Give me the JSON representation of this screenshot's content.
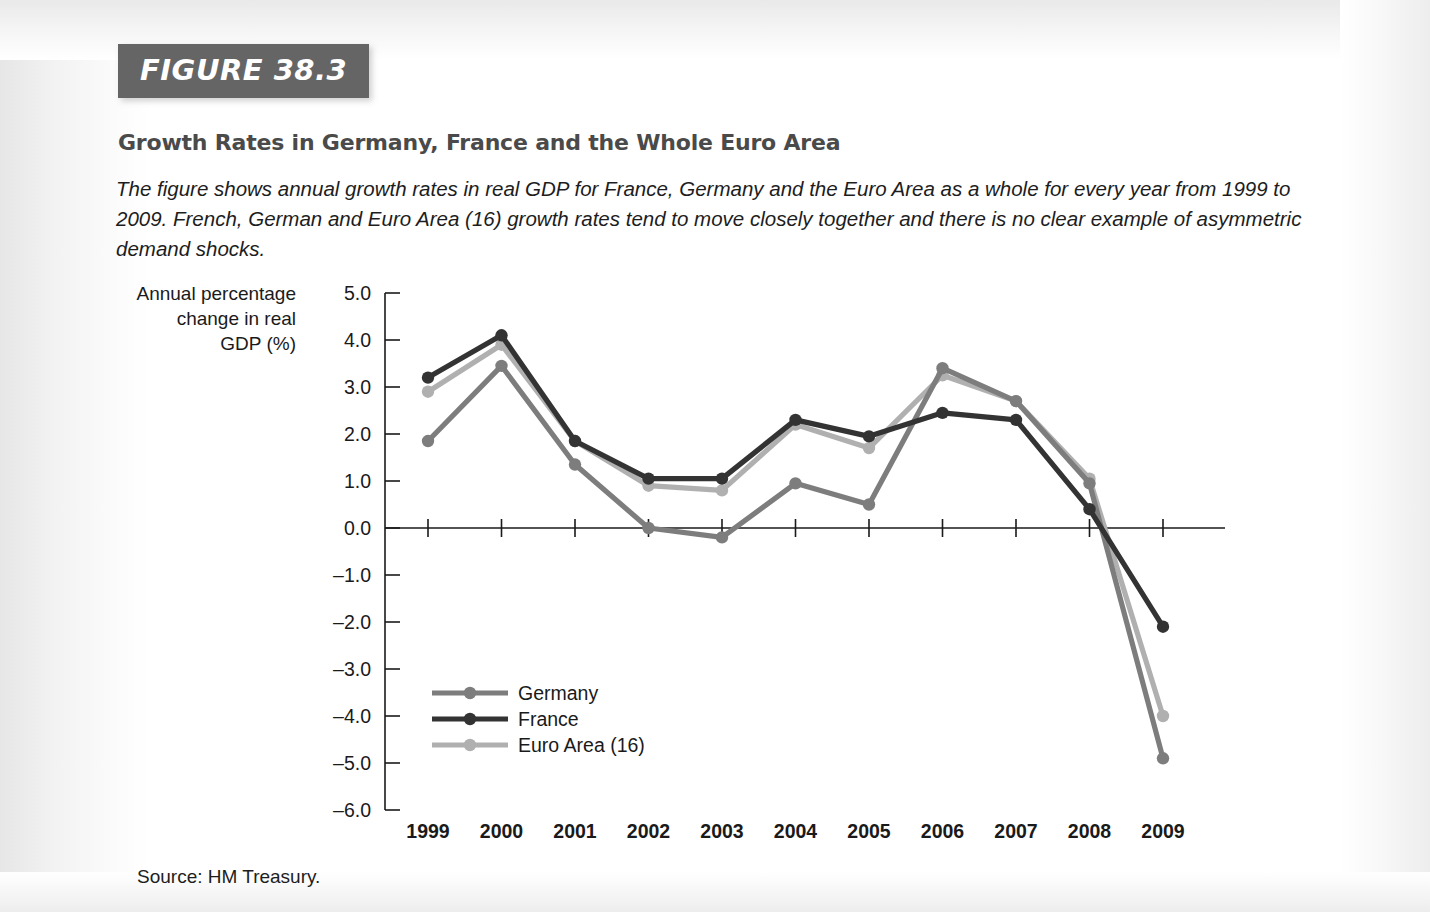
{
  "figure": {
    "banner_label": "FIGURE 38.3",
    "title": "Growth Rates in Germany, France and the Whole Euro Area",
    "description": "The figure shows annual growth rates in real GDP for France, Germany and the Euro Area as a whole for every year from 1999 to 2009. French, German and Euro Area (16) growth rates tend to move closely together and there is no clear example of asymmetric demand shocks.",
    "source": "Source: HM Treasury."
  },
  "colors": {
    "banner_background": "#656565",
    "title_text": "#4a4a4a",
    "body_text": "#1d1d1d",
    "germany": "#7d7d7d",
    "france": "#333333",
    "euro_area": "#b0b0b0",
    "axis": "#1a1a1a",
    "page_background": "#ffffff"
  },
  "chart_data": {
    "type": "line",
    "title": "Growth Rates in Germany, France and the Whole Euro Area",
    "xlabel": "",
    "ylabel": "Annual percentage change in real GDP (%)",
    "ylabel_lines": [
      "Annual percentage",
      "change in real",
      "GDP (%)"
    ],
    "categories": [
      "1999",
      "2000",
      "2001",
      "2002",
      "2003",
      "2004",
      "2005",
      "2006",
      "2007",
      "2008",
      "2009"
    ],
    "x": [
      1999,
      2000,
      2001,
      2002,
      2003,
      2004,
      2005,
      2006,
      2007,
      2008,
      2009
    ],
    "ylim": [
      -6.0,
      5.0
    ],
    "ytick_labels": [
      "5.0",
      "4.0",
      "3.0",
      "2.0",
      "1.0",
      "0.0",
      "–1.0",
      "–2.0",
      "–3.0",
      "–4.0",
      "–5.0",
      "–6.0"
    ],
    "yticks": [
      5.0,
      4.0,
      3.0,
      2.0,
      1.0,
      0.0,
      -1.0,
      -2.0,
      -3.0,
      -4.0,
      -5.0,
      -6.0
    ],
    "grid": false,
    "legend_position": "inside-lower-left",
    "markers": "filled-circle",
    "series": [
      {
        "name": "Germany",
        "color": "#7d7d7d",
        "values": [
          1.85,
          3.45,
          1.35,
          0.0,
          -0.2,
          0.95,
          0.5,
          3.4,
          2.7,
          0.95,
          -4.9
        ]
      },
      {
        "name": "France",
        "color": "#333333",
        "values": [
          3.2,
          4.1,
          1.85,
          1.05,
          1.05,
          2.3,
          1.95,
          2.45,
          2.3,
          0.4,
          -2.1
        ]
      },
      {
        "name": "Euro Area (16)",
        "color": "#b0b0b0",
        "values": [
          2.9,
          3.9,
          1.85,
          0.9,
          0.8,
          2.2,
          1.7,
          3.25,
          2.7,
          1.05,
          -4.0
        ]
      }
    ]
  }
}
